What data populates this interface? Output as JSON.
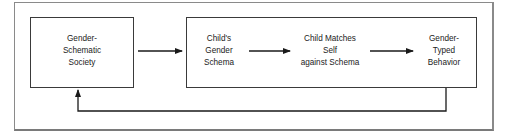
{
  "diagram": {
    "nodes": [
      {
        "id": "society",
        "lines": [
          "Gender-",
          "Schematic",
          "Society"
        ]
      },
      {
        "id": "schema",
        "lines": [
          "Child's",
          "Gender",
          "Schema"
        ]
      },
      {
        "id": "matches",
        "lines": [
          "Child Matches",
          "Self",
          "against Schema"
        ]
      },
      {
        "id": "behavior",
        "lines": [
          "Gender-",
          "Typed",
          "Behavior"
        ]
      }
    ],
    "edges": [
      {
        "from": "society",
        "to": "schema"
      },
      {
        "from": "schema",
        "to": "matches"
      },
      {
        "from": "matches",
        "to": "behavior"
      },
      {
        "from": "behavior",
        "to": "society",
        "type": "feedback"
      }
    ],
    "colors": {
      "line": "#1a1a1a",
      "box_border": "#3a3a3a",
      "frame_border": "#8a8a8a"
    }
  }
}
